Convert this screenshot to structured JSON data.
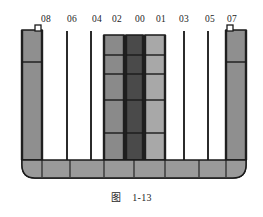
{
  "figure": {
    "caption_label": "图",
    "caption_number": "1-13",
    "background_color": "#ffffff",
    "outline_color": "#1a1a1a"
  },
  "columns": [
    {
      "id": "col-08",
      "label": "08",
      "label_x": 46,
      "type": "filled",
      "x": 22,
      "width": 20,
      "top": 30,
      "bottom": 160,
      "fill": "#8f8f8f",
      "dividers": [
        62
      ],
      "has_top_notch": true,
      "notch_side": "right"
    },
    {
      "id": "col-06",
      "label": "06",
      "label_x": 72,
      "type": "line",
      "x": 66,
      "width": 2,
      "top": 31,
      "bottom": 160,
      "fill": "#2b2b2b",
      "dividers": []
    },
    {
      "id": "col-04",
      "label": "04",
      "label_x": 97,
      "type": "line",
      "x": 90,
      "width": 2,
      "top": 31,
      "bottom": 160,
      "fill": "#2b2b2b",
      "dividers": []
    },
    {
      "id": "col-02",
      "label": "02",
      "label_x": 117,
      "type": "filled",
      "x": 104,
      "width": 20,
      "top": 35,
      "bottom": 160,
      "fill": "#8a8a8a",
      "dividers": [
        55,
        74,
        100,
        133
      ],
      "has_top_notch": false
    },
    {
      "id": "col-00",
      "label": "00",
      "label_x": 140,
      "type": "filled",
      "x": 126,
      "width": 17,
      "top": 35,
      "bottom": 160,
      "fill": "#4a4a4a",
      "dividers": [
        55,
        74,
        100,
        133
      ],
      "has_top_notch": false
    },
    {
      "id": "col-01",
      "label": "01",
      "label_x": 161,
      "type": "filled",
      "x": 145,
      "width": 20,
      "top": 35,
      "bottom": 160,
      "fill": "#a8a8a8",
      "dividers": [
        55,
        74,
        100,
        133
      ],
      "has_top_notch": false
    },
    {
      "id": "col-03",
      "label": "03",
      "label_x": 184,
      "type": "line",
      "x": 183,
      "width": 2,
      "top": 31,
      "bottom": 160,
      "fill": "#2b2b2b",
      "dividers": []
    },
    {
      "id": "col-05",
      "label": "05",
      "label_x": 210,
      "type": "line",
      "x": 207,
      "width": 2,
      "top": 31,
      "bottom": 160,
      "fill": "#2b2b2b",
      "dividers": []
    },
    {
      "id": "col-07",
      "label": "07",
      "label_x": 232,
      "type": "filled",
      "x": 226,
      "width": 20,
      "top": 30,
      "bottom": 160,
      "fill": "#8f8f8f",
      "dividers": [
        62
      ],
      "has_top_notch": true,
      "notch_side": "left"
    }
  ],
  "hull": {
    "left": 22,
    "right": 246,
    "top": 30,
    "bottom_bar_top": 160,
    "bottom_bar_bottom": 178,
    "corner_radius": 13,
    "fill": "#9a9a9a",
    "stroke": "#1a1a1a",
    "bottom_dividers": [
      42,
      70,
      104,
      134,
      165,
      199,
      226
    ]
  },
  "chart_data": {
    "type": "bar",
    "xlabel": "",
    "ylabel": "",
    "categories": [
      "08",
      "06",
      "04",
      "02",
      "00",
      "01",
      "03",
      "05",
      "07"
    ],
    "values": [
      5,
      0,
      0,
      5,
      5,
      5,
      0,
      0,
      5
    ],
    "series": [
      {
        "name": "stack height (tiers)",
        "values": [
          2,
          0,
          0,
          5,
          5,
          5,
          0,
          0,
          2
        ]
      }
    ],
    "grid": false,
    "legend": "none",
    "ylim": [
      0,
      5
    ]
  }
}
